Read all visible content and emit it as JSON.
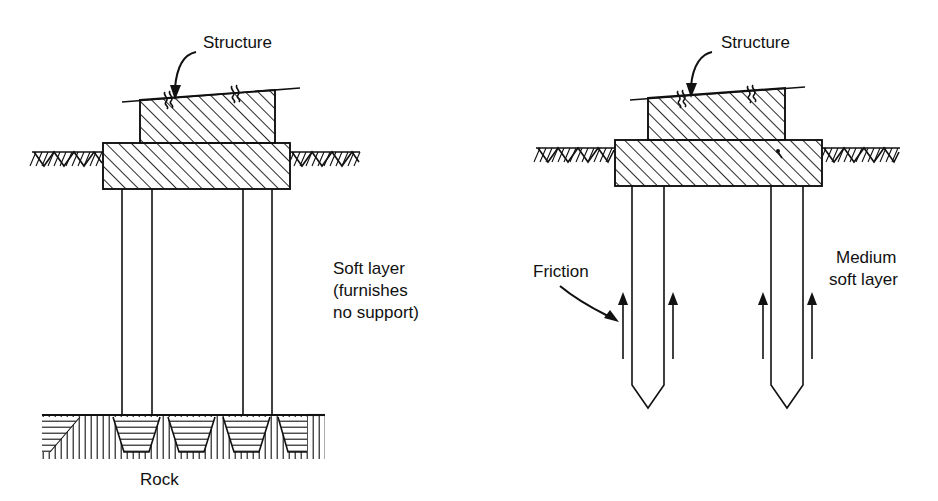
{
  "figure": {
    "background_color": "#ffffff",
    "line_color": "#111111",
    "width": 938,
    "height": 501
  },
  "panels": [
    {
      "id": "left",
      "name": "end-bearing-pile-panel",
      "labels": {
        "structure": "Structure",
        "soil_layer_line1": "Soft layer",
        "soil_layer_line2": "(furnishes",
        "soil_layer_line3": "no support)",
        "bearing_stratum": "Rock"
      }
    },
    {
      "id": "right",
      "name": "friction-pile-panel",
      "labels": {
        "structure": "Structure",
        "friction": "Friction",
        "soil_layer_line1": "Medium",
        "soil_layer_line2": "soft layer"
      }
    }
  ],
  "left_panel": {
    "structure_label": "Structure",
    "soft_layer_text": [
      "Soft layer",
      "(furnishes",
      "no support)"
    ],
    "rock_label": "Rock",
    "pile_count": 2
  },
  "right_panel": {
    "structure_label": "Structure",
    "friction_label": "Friction",
    "medium_soft_layer_text": [
      "Medium",
      "soft layer"
    ],
    "pile_count": 2,
    "friction_arrow_count": 4
  }
}
